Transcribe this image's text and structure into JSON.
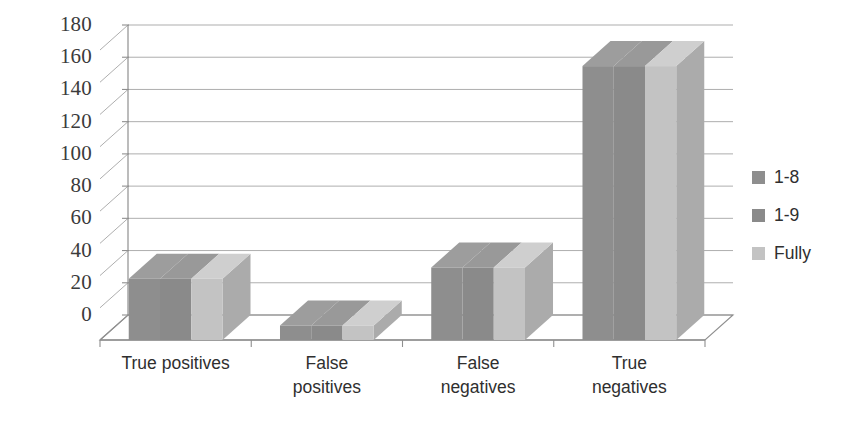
{
  "chart_data": {
    "type": "bar",
    "title": "",
    "subtitle": "",
    "xlabel": "",
    "ylabel": "",
    "categories": [
      "True positives",
      "False\npositives",
      "False\nnegatives",
      "True\nnegatives"
    ],
    "series": [
      {
        "name": "1-8",
        "values": [
          38,
          9,
          45,
          170
        ]
      },
      {
        "name": "1-9",
        "values": [
          38,
          9,
          45,
          170
        ]
      },
      {
        "name": "Fully",
        "values": [
          38,
          9,
          45,
          170
        ]
      }
    ],
    "ylim": [
      0,
      180
    ],
    "ytick_values": [
      0,
      20,
      40,
      60,
      80,
      100,
      120,
      140,
      160,
      180
    ],
    "ytick_labels": [
      "0",
      "20",
      "40",
      "60",
      "80",
      "100",
      "120",
      "140",
      "160",
      "180"
    ],
    "grid": true,
    "grid_axis": "y",
    "legend_position": "right",
    "style": "3d-clustered-column",
    "colors": {
      "series_front": [
        "#8e8e8e",
        "#8a8a8a",
        "#c3c3c3"
      ],
      "series_top": [
        "#9d9d9d",
        "#999999",
        "#cfcfcf"
      ],
      "series_side": [
        "#7a7a7a",
        "#767676",
        "#ababab"
      ],
      "grid_line": "#9a9a9a",
      "axis_line": "#8f8f8f",
      "tick_text": "#3b3b3b",
      "background": "#ffffff"
    }
  },
  "legend": {
    "items": [
      {
        "label": "1-8",
        "color": "#8e8e8e"
      },
      {
        "label": "1-9",
        "color": "#8a8a8a"
      },
      {
        "label": "Fully",
        "color": "#c3c3c3"
      }
    ]
  },
  "axes": {
    "y_ticks": [
      {
        "label": "180"
      },
      {
        "label": "160"
      },
      {
        "label": "140"
      },
      {
        "label": "120"
      },
      {
        "label": "100"
      },
      {
        "label": "80"
      },
      {
        "label": "60"
      },
      {
        "label": "40"
      },
      {
        "label": "20"
      },
      {
        "label": "0"
      }
    ],
    "x_ticks": [
      {
        "label": "True positives"
      },
      {
        "label": "False\npositives"
      },
      {
        "label": "False\nnegatives"
      },
      {
        "label": "True\nnegatives"
      }
    ]
  }
}
